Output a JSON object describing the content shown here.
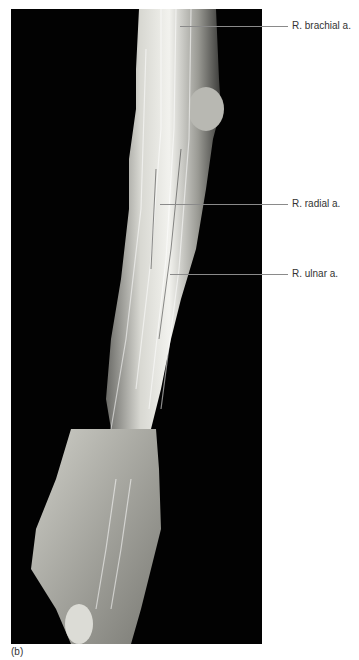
{
  "figure": {
    "caption": "(b)",
    "background_color": "#020202"
  },
  "labels": [
    {
      "text": "R. brachial a.",
      "y": 26
    },
    {
      "text": "R. radial a.",
      "y": 204
    },
    {
      "text": "R. ulnar a.",
      "y": 275
    }
  ]
}
